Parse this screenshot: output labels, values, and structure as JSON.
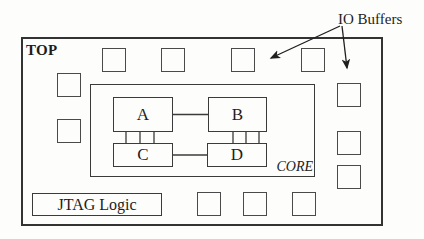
{
  "diagram": {
    "annotation": {
      "io_buffers_label": "IO Buffers",
      "arrow_count": 2
    },
    "chip": {
      "name_label": "TOP"
    },
    "core": {
      "name_label": "CORE",
      "blocks": [
        {
          "label": "A"
        },
        {
          "label": "B"
        },
        {
          "label": "C"
        },
        {
          "label": "D"
        }
      ],
      "connections": [
        "A-B",
        "C-D",
        "A-C bus (3 lines)",
        "B-D bus (3 lines)"
      ]
    },
    "jtag": {
      "label": "JTAG Logic"
    },
    "io_buffer_count": 12,
    "colors": {
      "line": "#3b3b3b",
      "outer_border": "#333333",
      "text": "#1d1d1d",
      "background": "#fdfdfc"
    }
  }
}
